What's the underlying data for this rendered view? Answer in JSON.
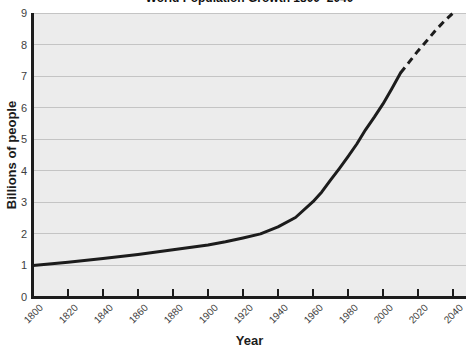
{
  "chart_data": {
    "type": "line",
    "title": "World Population Growth 1800–2040",
    "xlabel": "Year",
    "ylabel": "Billions of people",
    "xlim": [
      1800,
      2040
    ],
    "ylim": [
      0,
      9
    ],
    "x_ticks": [
      1800,
      1820,
      1840,
      1860,
      1880,
      1900,
      1920,
      1940,
      1960,
      1980,
      2000,
      2020,
      2040
    ],
    "y_ticks": [
      0,
      1,
      2,
      3,
      4,
      5,
      6,
      7,
      8,
      9
    ],
    "grid": "horizontal",
    "legend": "none",
    "series": [
      {
        "name": "world-population",
        "style": "solid",
        "points": [
          [
            1800,
            1.0
          ],
          [
            1820,
            1.1
          ],
          [
            1840,
            1.22
          ],
          [
            1860,
            1.35
          ],
          [
            1880,
            1.5
          ],
          [
            1900,
            1.65
          ],
          [
            1910,
            1.75
          ],
          [
            1920,
            1.87
          ],
          [
            1930,
            2.0
          ],
          [
            1940,
            2.22
          ],
          [
            1950,
            2.52
          ],
          [
            1960,
            3.02
          ],
          [
            1965,
            3.33
          ],
          [
            1970,
            3.7
          ],
          [
            1975,
            4.07
          ],
          [
            1980,
            4.45
          ],
          [
            1985,
            4.85
          ],
          [
            1990,
            5.3
          ],
          [
            1995,
            5.7
          ],
          [
            2000,
            6.12
          ],
          [
            2005,
            6.6
          ],
          [
            2010,
            7.1
          ]
        ]
      },
      {
        "name": "world-population-projected",
        "style": "dashed",
        "points": [
          [
            2010,
            7.1
          ],
          [
            2015,
            7.45
          ],
          [
            2020,
            7.8
          ],
          [
            2025,
            8.12
          ],
          [
            2030,
            8.45
          ],
          [
            2035,
            8.74
          ],
          [
            2040,
            9.0
          ]
        ]
      }
    ],
    "colors": {
      "curve": "#1c1c1c",
      "axis": "#1c1c1c",
      "gridline": "#c4c4c4",
      "plot_background": "#ececec",
      "tick_label": "#3e3e3e",
      "page_background": "#ffffff"
    }
  }
}
